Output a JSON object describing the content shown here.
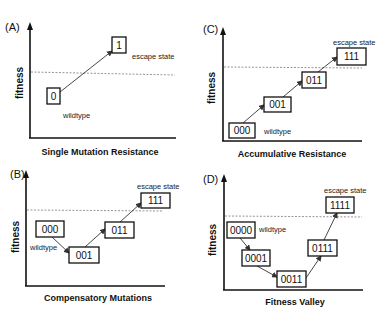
{
  "figure": {
    "panels": [
      {
        "id": "A",
        "label": "(A)",
        "y_axis_label": "fitness",
        "title": "Single Mutation Resistance",
        "nodes": [
          {
            "label": "0"
          },
          {
            "label": "1"
          }
        ],
        "edges": [
          [
            "0",
            "1"
          ]
        ],
        "annotations": {
          "wildtype": "wildtype",
          "escape": "escape state"
        }
      },
      {
        "id": "B",
        "label": "(B)",
        "y_axis_label": "fitness",
        "title": "Compensatory Mutations",
        "nodes": [
          {
            "label": "000"
          },
          {
            "label": "001"
          },
          {
            "label": "011"
          },
          {
            "label": "111"
          }
        ],
        "edges": [
          [
            "000",
            "001"
          ],
          [
            "001",
            "011"
          ],
          [
            "011",
            "111"
          ]
        ],
        "annotations": {
          "wildtype": "wildtype",
          "escape": "escape state"
        }
      },
      {
        "id": "C",
        "label": "(C)",
        "y_axis_label": "fitness",
        "title": "Accumulative Resistance",
        "nodes": [
          {
            "label": "000"
          },
          {
            "label": "001"
          },
          {
            "label": "011"
          },
          {
            "label": "111"
          }
        ],
        "edges": [
          [
            "000",
            "001"
          ],
          [
            "001",
            "011"
          ],
          [
            "011",
            "111"
          ]
        ],
        "annotations": {
          "wildtype": "wildtype",
          "escape": "escape state"
        }
      },
      {
        "id": "D",
        "label": "(D)",
        "y_axis_label": "fitness",
        "title": "Fitness Valley",
        "nodes": [
          {
            "label": "0000"
          },
          {
            "label": "0001"
          },
          {
            "label": "0011"
          },
          {
            "label": "0111"
          },
          {
            "label": "1111"
          }
        ],
        "edges": [
          [
            "0000",
            "0001"
          ],
          [
            "0001",
            "0011"
          ],
          [
            "0011",
            "0111"
          ],
          [
            "0111",
            "1111"
          ]
        ],
        "annotations": {
          "wildtype": "wildtype",
          "escape": "escape state"
        }
      }
    ]
  }
}
